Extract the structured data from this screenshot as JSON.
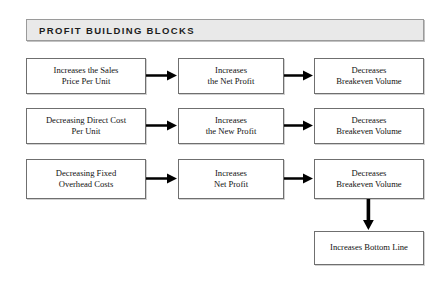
{
  "header": {
    "title": "Profit Building Blocks"
  },
  "diagram": {
    "type": "flowchart",
    "orientation": "left-to-right",
    "colors": {
      "banner_fill": "#e9e9e9",
      "banner_border": "#9a9a9a",
      "node_fill": "#ffffff",
      "node_border": "#6f6f6f",
      "arrow": "#000000",
      "text": "#121212",
      "page_background": "#ffffff"
    },
    "rows": [
      {
        "id": "row-sales-price",
        "driver": "Increases the Sales\nPrice Per Unit",
        "effect": "Increases\nthe Net Profit",
        "outcome": "Decreases\nBreakeven Volume"
      },
      {
        "id": "row-direct-cost",
        "driver": "Decreasing Direct Cost\nPer Unit",
        "effect": "Increases\nthe New Profit",
        "outcome": "Decreases\nBreakeven Volume"
      },
      {
        "id": "row-fixed-overhead",
        "driver": "Decreasing Fixed\nOverhead Costs",
        "effect": "Increases\nNet Profit",
        "outcome": "Decreases\nBreakeven Volume"
      }
    ],
    "final_node": "Increases Bottom Line",
    "arrow_icons": {
      "horizontal": "arrow-right-icon",
      "vertical": "arrow-down-icon"
    }
  }
}
